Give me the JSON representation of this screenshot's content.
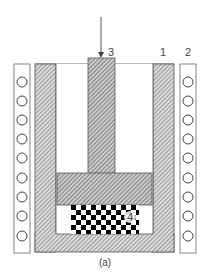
{
  "diagram": {
    "caption": "(a)",
    "labels": {
      "die": "1",
      "coil": "2",
      "punch": "3",
      "sample": "4"
    },
    "parts": [
      {
        "id": "1",
        "name": "die-wall"
      },
      {
        "id": "2",
        "name": "induction-coil"
      },
      {
        "id": "3",
        "name": "punch"
      },
      {
        "id": "4",
        "name": "sample"
      }
    ],
    "coil_turns_per_side": 9,
    "colors": {
      "outline": "#555555",
      "hatch": "#666666",
      "checker": "#000000"
    }
  }
}
